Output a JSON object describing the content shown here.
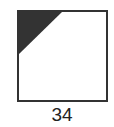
{
  "figure": {
    "label": "34",
    "shape": "square",
    "shaded_region": "top-left-triangle",
    "colors": {
      "border": "#333333",
      "fill": "#333333",
      "background": "#ffffff"
    }
  }
}
